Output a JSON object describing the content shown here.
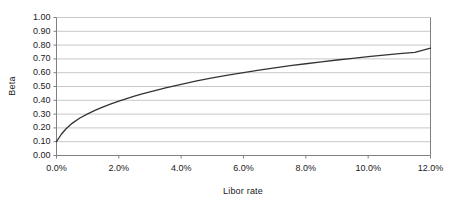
{
  "chart_data": {
    "type": "line",
    "title": "",
    "xlabel": "Libor rate",
    "ylabel": "Beta",
    "xlim": [
      0,
      12
    ],
    "ylim": [
      0,
      1.0
    ],
    "grid": "horizontal",
    "legend": "none",
    "x_tick_labels": [
      "0.0%",
      "2.0%",
      "4.0%",
      "6.0%",
      "8.0%",
      "10.0%",
      "12.0%"
    ],
    "x_tick_values": [
      0,
      2,
      4,
      6,
      8,
      10,
      12
    ],
    "y_tick_labels": [
      "0.00",
      "0.10",
      "0.20",
      "0.30",
      "0.40",
      "0.50",
      "0.60",
      "0.70",
      "0.80",
      "0.90",
      "1.00"
    ],
    "y_tick_values": [
      0,
      0.1,
      0.2,
      0.3,
      0.4,
      0.5,
      0.6,
      0.7,
      0.8,
      0.9,
      1.0
    ],
    "series": [
      {
        "name": "Beta",
        "color": "#333333",
        "x": [
          0.0,
          0.15,
          0.3,
          0.5,
          0.75,
          1.0,
          1.25,
          1.5,
          1.75,
          2.0,
          2.25,
          2.5,
          2.75,
          3.0,
          3.25,
          3.5,
          3.75,
          4.0,
          4.25,
          4.5,
          4.75,
          5.0,
          5.5,
          6.0,
          6.5,
          7.0,
          7.5,
          8.0,
          8.5,
          9.0,
          9.5,
          10.0,
          10.5,
          11.0,
          11.5,
          12.0
        ],
        "y": [
          0.1,
          0.152,
          0.192,
          0.233,
          0.272,
          0.302,
          0.329,
          0.353,
          0.374,
          0.394,
          0.413,
          0.43,
          0.446,
          0.461,
          0.476,
          0.49,
          0.503,
          0.516,
          0.528,
          0.54,
          0.551,
          0.562,
          0.582,
          0.601,
          0.619,
          0.635,
          0.651,
          0.665,
          0.679,
          0.692,
          0.704,
          0.716,
          0.727,
          0.738,
          0.748,
          0.778
        ]
      }
    ]
  },
  "axes": {
    "y_title": "Beta",
    "x_title": "Libor rate"
  },
  "style": {
    "background": "#ffffff",
    "gridline_color": "#c8c8c8",
    "axis_color": "#808080",
    "line_color": "#333333",
    "text_color": "#1a1a1a"
  }
}
